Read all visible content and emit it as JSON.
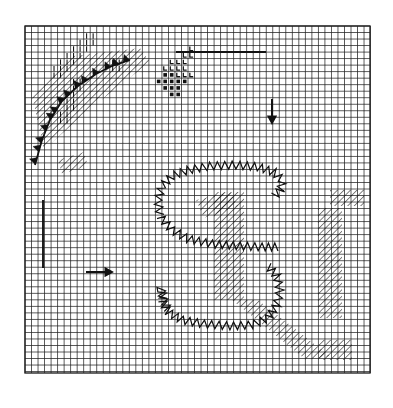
{
  "figure": {
    "title": "Gridded Synoptic Analysis Chart",
    "caption": "",
    "background_color": "#ffffff",
    "ink_color": "#1a1a1a",
    "grid_color": "#2b2b2b"
  },
  "chart_data": {
    "type": "map",
    "title": "Gridded Synoptic Analysis Chart",
    "subtitle": "",
    "xlabel": "",
    "ylabel": "",
    "grid": true,
    "legend_position": "none",
    "projection_note": "regular model grid, plan view",
    "plot_area": {
      "x": 25,
      "y": 26,
      "width": 345,
      "height": 347
    },
    "grid_spec": {
      "cell_size_px": 6.52,
      "n_cols": 53,
      "n_rows": 53,
      "line_color": "#2b2b2b",
      "line_width_px": 0.9,
      "border_line_width_px": 1.4
    },
    "annotations": [
      {
        "name": "arrow-down",
        "symbol": "arrow",
        "direction": "down",
        "x": 272,
        "y": 112,
        "length": 26
      },
      {
        "name": "arrow-right",
        "symbol": "arrow",
        "direction": "right",
        "x": 100,
        "y": 272,
        "length": 28
      },
      {
        "name": "pointer-line-horizontal",
        "symbol": "line",
        "x1": 176,
        "y1": 52,
        "x2": 266,
        "y2": 52
      },
      {
        "name": "pointer-line-vertical",
        "symbol": "line",
        "x1": 43,
        "y1": 200,
        "x2": 43,
        "y2": 268
      }
    ],
    "features": [
      {
        "id": "cold-front",
        "label": "cold front",
        "symbol": "filled-triangle-barbs",
        "path": [
          [
            35,
            165
          ],
          [
            42,
            140
          ],
          [
            50,
            120
          ],
          [
            62,
            101
          ],
          [
            78,
            86
          ],
          [
            96,
            74
          ],
          [
            112,
            66
          ],
          [
            130,
            60
          ]
        ],
        "barb_count": 14,
        "barb_size_px": 7
      },
      {
        "id": "zigzag-boundary-upper",
        "label": "sawtooth boundary (upper lobe)",
        "symbol": "zigzag",
        "path": [
          [
            160,
            215
          ],
          [
            158,
            200
          ],
          [
            162,
            186
          ],
          [
            172,
            176
          ],
          [
            188,
            170
          ],
          [
            210,
            166
          ],
          [
            236,
            165
          ],
          [
            258,
            167
          ],
          [
            274,
            172
          ],
          [
            282,
            180
          ],
          [
            281,
            190
          ],
          [
            274,
            196
          ]
        ],
        "amplitude_px": 4,
        "wavelength_px": 7
      },
      {
        "id": "zigzag-boundary-mid",
        "label": "sawtooth boundary (mid band)",
        "symbol": "zigzag",
        "path": [
          [
            160,
            216
          ],
          [
            172,
            230
          ],
          [
            188,
            239
          ],
          [
            212,
            244
          ],
          [
            240,
            246
          ],
          [
            262,
            247
          ],
          [
            278,
            247
          ]
        ],
        "amplitude_px": 4,
        "wavelength_px": 7
      },
      {
        "id": "zigzag-boundary-lower",
        "label": "sawtooth boundary (lower lobe)",
        "symbol": "zigzag",
        "path": [
          [
            162,
            300
          ],
          [
            168,
            312
          ],
          [
            182,
            320
          ],
          [
            204,
            324
          ],
          [
            230,
            326
          ],
          [
            252,
            325
          ],
          [
            268,
            318
          ],
          [
            277,
            305
          ],
          [
            280,
            290
          ],
          [
            277,
            276
          ],
          [
            268,
            266
          ]
        ],
        "amplitude_px": 4,
        "wavelength_px": 7
      },
      {
        "id": "zigzag-tail-left",
        "label": "sawtooth tail",
        "symbol": "zigzag",
        "path": [
          [
            163,
            299
          ],
          [
            161,
            288
          ],
          [
            164,
            300
          ],
          [
            168,
            310
          ]
        ],
        "amplitude_px": 4,
        "wavelength_px": 7
      },
      {
        "id": "hatch-band-center",
        "label": "diagonal hatching (central block)",
        "symbol": "diagonal-hatch",
        "region": [
          [
            214,
            192
          ],
          [
            244,
            192
          ],
          [
            244,
            300
          ],
          [
            214,
            300
          ]
        ],
        "hatch_angle_deg": 45,
        "hatch_spacing_px": 4.5
      },
      {
        "id": "hatch-band-upper",
        "label": "diagonal hatching (upper streak)",
        "symbol": "diagonal-hatch",
        "region": [
          [
            196,
            200
          ],
          [
            230,
            192
          ],
          [
            238,
            206
          ],
          [
            204,
            218
          ]
        ],
        "hatch_angle_deg": 45,
        "hatch_spacing_px": 4.5
      },
      {
        "id": "hatch-band-right",
        "label": "diagonal hatching (right column)",
        "symbol": "diagonal-hatch",
        "region": [
          [
            318,
            208
          ],
          [
            342,
            208
          ],
          [
            342,
            318
          ],
          [
            318,
            318
          ]
        ],
        "hatch_angle_deg": 45,
        "hatch_spacing_px": 4.5
      },
      {
        "id": "hatch-band-right-top",
        "label": "diagonal hatching (right top)",
        "symbol": "diagonal-hatch",
        "region": [
          [
            330,
            190
          ],
          [
            364,
            190
          ],
          [
            364,
            206
          ],
          [
            330,
            206
          ]
        ],
        "hatch_angle_deg": 45,
        "hatch_spacing_px": 4.5
      },
      {
        "id": "hatch-band-bottom-diag",
        "label": "diagonal hatching (bottom sweep)",
        "symbol": "diagonal-hatch",
        "region": [
          [
            232,
            300
          ],
          [
            258,
            300
          ],
          [
            330,
            356
          ],
          [
            306,
            360
          ]
        ],
        "hatch_angle_deg": 45,
        "hatch_spacing_px": 4.5
      },
      {
        "id": "hatch-band-bottom-right",
        "label": "diagonal hatching (bottom right)",
        "symbol": "diagonal-hatch",
        "region": [
          [
            318,
            340
          ],
          [
            352,
            340
          ],
          [
            352,
            360
          ],
          [
            318,
            360
          ]
        ],
        "hatch_angle_deg": 45,
        "hatch_spacing_px": 4.5
      },
      {
        "id": "hatch-front-zone",
        "label": "diagonal hatching (frontal zone)",
        "symbol": "diagonal-hatch",
        "region": [
          [
            32,
            96
          ],
          [
            74,
            56
          ],
          [
            140,
            48
          ],
          [
            150,
            62
          ],
          [
            86,
            112
          ],
          [
            44,
            150
          ]
        ],
        "hatch_angle_deg": 45,
        "hatch_spacing_px": 4.5
      },
      {
        "id": "hatch-small-left",
        "label": "diagonal hatching (small patch)",
        "symbol": "diagonal-hatch",
        "region": [
          [
            58,
            160
          ],
          [
            84,
            152
          ],
          [
            88,
            166
          ],
          [
            62,
            174
          ]
        ],
        "hatch_angle_deg": 45,
        "hatch_spacing_px": 4.5
      }
    ],
    "symbol_cells": [
      {
        "symbol": "L",
        "col": 25,
        "row": 3
      },
      {
        "symbol": "L",
        "col": 24,
        "row": 4
      },
      {
        "symbol": "L",
        "col": 25,
        "row": 4
      },
      {
        "symbol": "L",
        "col": 22,
        "row": 5
      },
      {
        "symbol": "L",
        "col": 23,
        "row": 5
      },
      {
        "symbol": "L",
        "col": 24,
        "row": 5
      },
      {
        "symbol": "L",
        "col": 21,
        "row": 6
      },
      {
        "symbol": "L",
        "col": 22,
        "row": 6
      },
      {
        "symbol": "L",
        "col": 23,
        "row": 6
      },
      {
        "symbol": "L",
        "col": 24,
        "row": 6
      },
      {
        "symbol": "square",
        "col": 21,
        "row": 7
      },
      {
        "symbol": "square",
        "col": 22,
        "row": 7
      },
      {
        "symbol": "L",
        "col": 23,
        "row": 7
      },
      {
        "symbol": "L",
        "col": 24,
        "row": 7
      },
      {
        "symbol": "L",
        "col": 25,
        "row": 7
      },
      {
        "symbol": "square",
        "col": 20,
        "row": 8
      },
      {
        "symbol": "square",
        "col": 21,
        "row": 8
      },
      {
        "symbol": "square",
        "col": 22,
        "row": 8
      },
      {
        "symbol": "square",
        "col": 23,
        "row": 8
      },
      {
        "symbol": "square",
        "col": 24,
        "row": 8
      },
      {
        "symbol": "square",
        "col": 21,
        "row": 9
      },
      {
        "symbol": "square",
        "col": 22,
        "row": 9
      },
      {
        "symbol": "square",
        "col": 23,
        "row": 9
      },
      {
        "symbol": "square",
        "col": 22,
        "row": 10
      },
      {
        "symbol": "square",
        "col": 23,
        "row": 10
      }
    ],
    "tick_cells": [
      {
        "col": 9,
        "row": 1
      },
      {
        "col": 10,
        "row": 1
      },
      {
        "col": 8,
        "row": 2
      },
      {
        "col": 9,
        "row": 2
      },
      {
        "col": 10,
        "row": 2
      },
      {
        "col": 7,
        "row": 3
      },
      {
        "col": 8,
        "row": 3
      },
      {
        "col": 9,
        "row": 3
      },
      {
        "col": 6,
        "row": 4
      },
      {
        "col": 7,
        "row": 4
      },
      {
        "col": 8,
        "row": 4
      },
      {
        "col": 5,
        "row": 5
      },
      {
        "col": 6,
        "row": 5
      },
      {
        "col": 7,
        "row": 5
      },
      {
        "col": 13,
        "row": 5
      },
      {
        "col": 14,
        "row": 5
      },
      {
        "col": 4,
        "row": 6
      },
      {
        "col": 5,
        "row": 6
      },
      {
        "col": 6,
        "row": 6
      },
      {
        "col": 13,
        "row": 6
      },
      {
        "col": 14,
        "row": 6
      },
      {
        "col": 4,
        "row": 7
      },
      {
        "col": 5,
        "row": 7
      },
      {
        "col": 7,
        "row": 8
      },
      {
        "col": 8,
        "row": 8
      },
      {
        "col": 7,
        "row": 9
      },
      {
        "col": 8,
        "row": 9
      },
      {
        "col": 6,
        "row": 10
      },
      {
        "col": 7,
        "row": 10
      },
      {
        "col": 6,
        "row": 11
      },
      {
        "col": 7,
        "row": 11
      },
      {
        "col": 6,
        "row": 12
      },
      {
        "col": 7,
        "row": 12
      },
      {
        "col": 5,
        "row": 13
      },
      {
        "col": 6,
        "row": 13
      },
      {
        "col": 5,
        "row": 14
      },
      {
        "col": 6,
        "row": 14
      }
    ]
  }
}
